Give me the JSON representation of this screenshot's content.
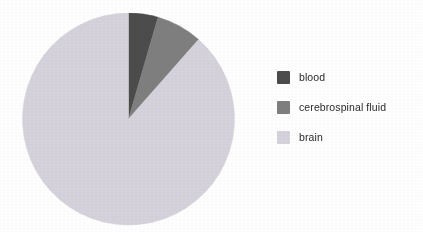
{
  "figure": {
    "background_color": "#ffffff",
    "text_color": "#2b2b2b"
  },
  "chart_data": {
    "type": "pie",
    "title": "",
    "subtitle": "",
    "xlabel": "",
    "ylabel": "",
    "grid": false,
    "legend_position": "right",
    "start_angle_deg": 0,
    "direction": "clockwise",
    "categories": [
      "blood",
      "cerebrospinal fluid",
      "brain"
    ],
    "values": [
      4.5,
      7.0,
      88.5
    ],
    "unit": "%",
    "angles_deg": [
      16,
      25,
      319
    ],
    "colors": [
      "#4c4c4c",
      "#7f7f80",
      "#d6d3dd"
    ],
    "slices": [
      {
        "label": "blood",
        "value": 4.5,
        "angle_deg": 16,
        "color": "#4c4c4c"
      },
      {
        "label": "cerebrospinal fluid",
        "value": 7.0,
        "angle_deg": 25,
        "color": "#7f7f80"
      },
      {
        "label": "brain",
        "value": 88.5,
        "angle_deg": 319,
        "color": "#d6d3dd"
      }
    ],
    "annotations": []
  },
  "legend": {
    "items": [
      {
        "label": "blood",
        "color": "#4c4c4c"
      },
      {
        "label": "cerebrospinal fluid",
        "color": "#7f7f80"
      },
      {
        "label": "brain",
        "color": "#d6d3dd"
      }
    ]
  }
}
